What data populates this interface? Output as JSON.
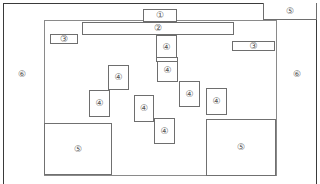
{
  "diagram": {
    "title": "",
    "labels": {
      "one": "①",
      "two": "②",
      "three": "③",
      "four": "④",
      "five": "⑤",
      "six": "⑥"
    },
    "regions": [
      {
        "id": "box-1",
        "label": "①"
      },
      {
        "id": "box-2",
        "label": "②"
      },
      {
        "id": "box-3-left",
        "label": "③"
      },
      {
        "id": "box-3-right",
        "label": "③"
      },
      {
        "id": "box-4-a",
        "label": "④"
      },
      {
        "id": "box-4-b",
        "label": "④"
      },
      {
        "id": "box-4-c",
        "label": "④"
      },
      {
        "id": "box-4-d",
        "label": "④"
      },
      {
        "id": "box-4-e",
        "label": "④"
      },
      {
        "id": "box-4-f",
        "label": "④"
      },
      {
        "id": "box-4-g",
        "label": "④"
      },
      {
        "id": "box-4-h",
        "label": "④"
      },
      {
        "id": "box-5-top-right",
        "label": "⑤"
      },
      {
        "id": "box-5-bottom-left",
        "label": "⑤"
      },
      {
        "id": "box-5-bottom-right",
        "label": "⑤"
      },
      {
        "id": "side-left",
        "label": "⑥"
      },
      {
        "id": "side-right",
        "label": "⑥"
      }
    ],
    "colors": {
      "frame": "#3a3a3a",
      "inner": "#8a8a8a",
      "box": "#6e6e6e",
      "label": "#555555"
    }
  }
}
